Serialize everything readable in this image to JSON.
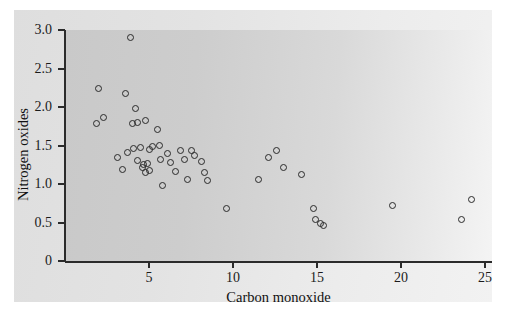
{
  "chart_data": {
    "type": "scatter",
    "title": "",
    "xlabel": "Carbon monoxide",
    "ylabel": "Nitrogen oxides",
    "xlim": [
      0,
      25.4
    ],
    "ylim": [
      0,
      3.1
    ],
    "grid": false,
    "legend": null,
    "xticks": [
      5,
      10,
      15,
      20,
      25
    ],
    "xticklabels": [
      "5",
      "10",
      "15",
      "20",
      "25"
    ],
    "yticks": [
      0,
      0.5,
      1.0,
      1.5,
      2.0,
      2.5,
      3.0
    ],
    "yticklabels": [
      "0",
      "0.5",
      "1.0",
      "1.5",
      "2.0",
      "2.5",
      "3.0"
    ],
    "marker": "open-circle",
    "marker_color": "#2a2a2a",
    "points": [
      {
        "x": 2.0,
        "y": 2.24
      },
      {
        "x": 1.9,
        "y": 1.79
      },
      {
        "x": 2.3,
        "y": 1.86
      },
      {
        "x": 3.1,
        "y": 1.34
      },
      {
        "x": 3.4,
        "y": 1.19
      },
      {
        "x": 3.6,
        "y": 2.17
      },
      {
        "x": 3.7,
        "y": 1.41
      },
      {
        "x": 3.9,
        "y": 2.9
      },
      {
        "x": 4.0,
        "y": 1.78
      },
      {
        "x": 4.1,
        "y": 1.46
      },
      {
        "x": 4.2,
        "y": 1.98
      },
      {
        "x": 4.3,
        "y": 1.8
      },
      {
        "x": 4.3,
        "y": 1.3
      },
      {
        "x": 4.5,
        "y": 1.47
      },
      {
        "x": 4.6,
        "y": 1.22
      },
      {
        "x": 4.7,
        "y": 1.25
      },
      {
        "x": 4.8,
        "y": 1.82
      },
      {
        "x": 4.8,
        "y": 1.15
      },
      {
        "x": 4.9,
        "y": 1.26
      },
      {
        "x": 5.0,
        "y": 1.45
      },
      {
        "x": 5.0,
        "y": 1.18
      },
      {
        "x": 5.2,
        "y": 1.49
      },
      {
        "x": 5.5,
        "y": 1.71
      },
      {
        "x": 5.6,
        "y": 1.5
      },
      {
        "x": 5.7,
        "y": 1.32
      },
      {
        "x": 5.8,
        "y": 0.98
      },
      {
        "x": 6.1,
        "y": 1.4
      },
      {
        "x": 6.3,
        "y": 1.28
      },
      {
        "x": 6.6,
        "y": 1.16
      },
      {
        "x": 6.9,
        "y": 1.43
      },
      {
        "x": 7.1,
        "y": 1.32
      },
      {
        "x": 7.3,
        "y": 1.06
      },
      {
        "x": 7.5,
        "y": 1.44
      },
      {
        "x": 7.7,
        "y": 1.37
      },
      {
        "x": 8.1,
        "y": 1.29
      },
      {
        "x": 8.3,
        "y": 1.15
      },
      {
        "x": 8.5,
        "y": 1.05
      },
      {
        "x": 9.6,
        "y": 0.68
      },
      {
        "x": 11.5,
        "y": 1.06
      },
      {
        "x": 12.1,
        "y": 1.35
      },
      {
        "x": 12.6,
        "y": 1.43
      },
      {
        "x": 13.0,
        "y": 1.22
      },
      {
        "x": 14.1,
        "y": 1.12
      },
      {
        "x": 14.8,
        "y": 0.68
      },
      {
        "x": 14.9,
        "y": 0.54
      },
      {
        "x": 15.2,
        "y": 0.49
      },
      {
        "x": 15.4,
        "y": 0.46
      },
      {
        "x": 19.5,
        "y": 0.72
      },
      {
        "x": 23.6,
        "y": 0.54
      },
      {
        "x": 24.2,
        "y": 0.8
      }
    ]
  }
}
